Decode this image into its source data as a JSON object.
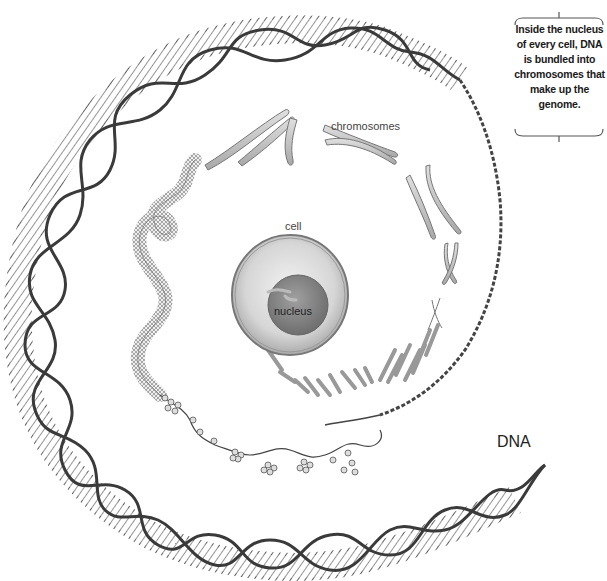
{
  "diagram": {
    "labels": {
      "chromosomes": "chromosomes",
      "cell": "cell",
      "nucleus": "nucleus",
      "dna": "DNA"
    },
    "callout": {
      "text": "Inside the nucleus of every cell, DNA is bundled into chromosomes that make up the genome."
    },
    "colors": {
      "background": "#ffffff",
      "strand": "#3a3a3a",
      "chromosome_fill": "#c8c8c8",
      "cell_fill": "#dcdcdc",
      "nucleus_fill": "#8a8a8a"
    }
  }
}
